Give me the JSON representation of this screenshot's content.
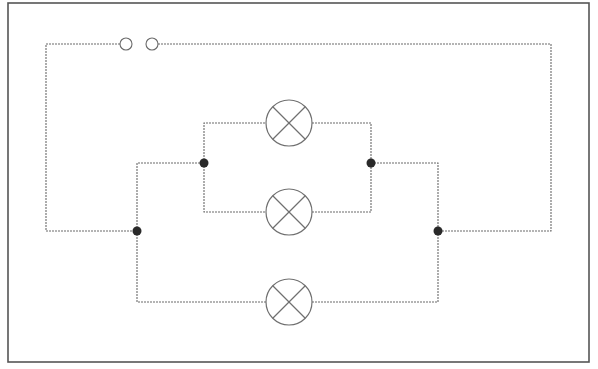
{
  "diagram": {
    "type": "circuit-schematic",
    "colors": {
      "wire": "#6a6a6a",
      "frame": "#555555",
      "junction": "#2a2a2a",
      "background": "#ffffff"
    },
    "frame": {
      "x": 8,
      "y": 3,
      "width": 581,
      "height": 359
    },
    "switch": {
      "state": "open",
      "terminals": [
        {
          "cx": 126,
          "cy": 44,
          "r": 6
        },
        {
          "cx": 152,
          "cy": 44,
          "r": 6
        }
      ]
    },
    "lamps": [
      {
        "id": "lamp-top",
        "cx": 289,
        "cy": 123,
        "r": 23
      },
      {
        "id": "lamp-middle",
        "cx": 289,
        "cy": 212,
        "r": 23
      },
      {
        "id": "lamp-bottom",
        "cx": 289,
        "cy": 302,
        "r": 23
      }
    ],
    "junctions": [
      {
        "cx": 204,
        "cy": 163
      },
      {
        "cx": 371,
        "cy": 163
      },
      {
        "cx": 137,
        "cy": 231
      },
      {
        "cx": 438,
        "cy": 231
      }
    ],
    "wires": [
      "M120 44 H46 V231 H137",
      "M158 44 H551 V231 H438",
      "M137 231 V163 H204",
      "M137 231 V302 H266",
      "M204 163 V123 H266",
      "M204 163 V212 H266",
      "M312 123 H371 V163",
      "M312 212 H371 V163",
      "M371 163 H438 V231",
      "M312 302 H438 V231"
    ]
  }
}
